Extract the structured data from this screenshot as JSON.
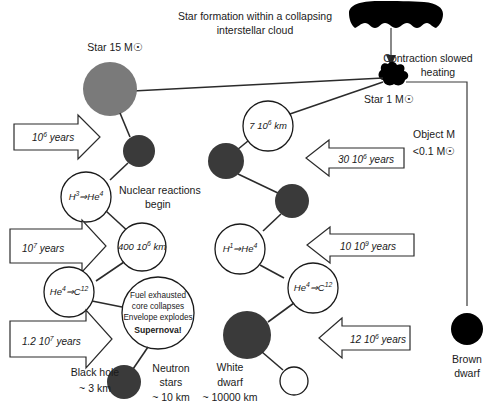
{
  "diagram": {
    "title": "Star formation within a collapsing interstellar cloud",
    "title_line1": "Star formation within a collapsing",
    "title_line2": "interstellar cloud",
    "colors": {
      "gray_star": "#7a7a7a",
      "dark_body": "#3a3a3a",
      "black_body": "#000000",
      "stroke": "#1a1a1a",
      "background": "#ffffff"
    }
  },
  "cloud": {
    "name": "interstellar-cloud",
    "arrow_label": ""
  },
  "protostar": {
    "label": "Star 1 M☉"
  },
  "contraction": {
    "line1": "Contraction slowed",
    "line2": "heating"
  },
  "left_branch": {
    "star_label": "Star 15 M☉",
    "arrows": [
      {
        "base": "10",
        "exp": "6",
        "unit": "years",
        "full": "10⁶ years"
      },
      {
        "base": "10",
        "exp": "7",
        "unit": "years",
        "full": "10⁷ years"
      },
      {
        "base": "1.2 10",
        "exp": "7",
        "unit": "years",
        "full": "1.2 10⁷ years"
      }
    ],
    "reaction1": {
      "from": "H",
      "from_sup": "3",
      "arrow": "⇒",
      "to": "He",
      "to_sup": "4"
    },
    "reaction1_note_line1": "Nuclear reactions",
    "reaction1_note_line2": "begin",
    "size_circle": {
      "base": "400 10",
      "exp": "6",
      "unit": "km",
      "full": "400 10⁶ km"
    },
    "reaction2": {
      "from": "He",
      "from_sup": "4",
      "arrow": "⇒",
      "to": "C",
      "to_sup": "12"
    },
    "supernova_lines": [
      "Fuel exhausted",
      "core collapses",
      "Envelope explodes"
    ],
    "supernova_bold": "Supernova!",
    "black_hole_line1": "Black hole",
    "black_hole_line2": "~ 3 km",
    "neutron_line1": "Neutron",
    "neutron_line2": "stars",
    "neutron_line3": "~ 10 km"
  },
  "right_branch": {
    "size_circle": {
      "base": "7 10",
      "exp": "6",
      "unit": "km",
      "full": "7 10⁶ km"
    },
    "arrows": [
      {
        "base": "30 10",
        "exp": "6",
        "unit": "years",
        "full": "30 10⁶ years"
      },
      {
        "base": "10 10",
        "exp": "9",
        "unit": "years",
        "full": "10 10⁹ years"
      },
      {
        "base": "12 10",
        "exp": "6",
        "unit": "years",
        "full": "12 10⁶ years"
      }
    ],
    "reaction1": {
      "from": "H",
      "from_sup": "1",
      "arrow": "⇒",
      "to": "He",
      "to_sup": "4"
    },
    "reaction2": {
      "from": "He",
      "from_sup": "4",
      "arrow": "⇒",
      "to": "C",
      "to_sup": "12"
    },
    "white_dwarf_line1": "White",
    "white_dwarf_line2": "dwarf",
    "white_dwarf_line3": "~ 10000 km"
  },
  "far_right_branch": {
    "object_line1": "Object M",
    "object_line2": "<0.1 M☉",
    "brown_dwarf_line1": "Brown",
    "brown_dwarf_line2": "dwarf"
  }
}
